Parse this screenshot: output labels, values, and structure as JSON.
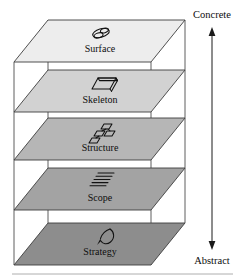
{
  "diagram": {
    "background": "#ffffff",
    "axis": {
      "top_label": "Concrete",
      "bottom_label": "Abstract",
      "orientation": "vertical",
      "arrow": "double-headed"
    },
    "planes": [
      {
        "id": "surface",
        "label": "Surface",
        "icon": "overlapping-ellipses-icon",
        "fill": "#ededed",
        "order": 1,
        "position": "top"
      },
      {
        "id": "skeleton",
        "label": "Skeleton",
        "icon": "parallelogram-page-icon",
        "fill": "#d2d2d2",
        "order": 2,
        "position": "upper-middle"
      },
      {
        "id": "structure",
        "label": "Structure",
        "icon": "linked-nodes-icon",
        "fill": "#b6b6b6",
        "order": 3,
        "position": "middle"
      },
      {
        "id": "scope",
        "label": "Scope",
        "icon": "text-lines-list-icon",
        "fill": "#a3a3a3",
        "order": 4,
        "position": "lower-middle"
      },
      {
        "id": "strategy",
        "label": "Strategy",
        "icon": "pen-nib-icon",
        "fill": "#8d8d8d",
        "order": 5,
        "position": "bottom"
      }
    ],
    "colors": {
      "frame_stroke": "#5e5e5e",
      "plane_stroke": "#3d3d3d",
      "text": "#0d0d0d",
      "arrow": "#1a1a1a"
    }
  }
}
